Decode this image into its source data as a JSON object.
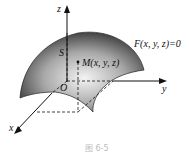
{
  "diagram": {
    "type": "3d-surface",
    "axes": {
      "x": "x",
      "y": "y",
      "z": "z",
      "origin": "O"
    },
    "surface_label": "S",
    "equation": "F(x, y, z)=0",
    "point_label": "M(x, y, z)",
    "caption": "图 6-5",
    "colors": {
      "surface_dark": "#3a3a3a",
      "surface_light": "#f0f0f0",
      "axis": "#111111"
    }
  }
}
